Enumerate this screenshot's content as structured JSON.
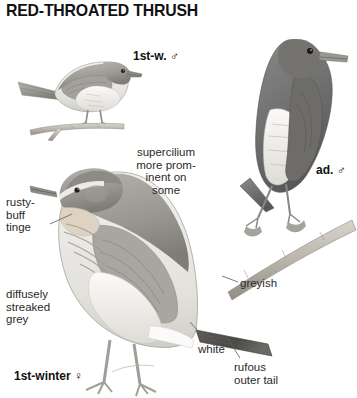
{
  "plate": {
    "title": "RED-THROATED THRUSH",
    "background_color": "#ffffff",
    "text_color": "#2a2a2a",
    "title_color": "#111111"
  },
  "captions": {
    "first_winter_male": "1st-w. ♂",
    "adult_male": "ad. ♂",
    "first_winter_female": "1st-winter ♀"
  },
  "annotations": {
    "supercilium": "supercilium\nmore prom-\ninent on\nsome",
    "rusty_buff": "rusty-\nbuff\ntinge",
    "diffusely_streaked": "diffusely\nstreaked\ngrey",
    "greyish": "greyish",
    "white": "white",
    "rufous_outer_tail": "rufous\nouter tail"
  },
  "figures": [
    {
      "name": "first-winter-male-bird",
      "caption": "1st-w. ♂",
      "posture": "perched on horizontal twig, side view facing right",
      "plumage": "grey-brown upperparts, pale whitish underparts with faint streaking"
    },
    {
      "name": "adult-male-bird",
      "caption": "ad. ♂",
      "posture": "perched upright on diagonal branch, facing right",
      "plumage": "dark slate-grey head, breast and upperparts, whitish belly and flanks"
    },
    {
      "name": "first-winter-female-bird",
      "caption": "1st-winter ♀",
      "posture": "standing on ground, side view facing left, tail to the right",
      "plumage": "pale supercilium, rusty-buff throat, diffusely streaked grey breast, rufous outer tail"
    }
  ]
}
